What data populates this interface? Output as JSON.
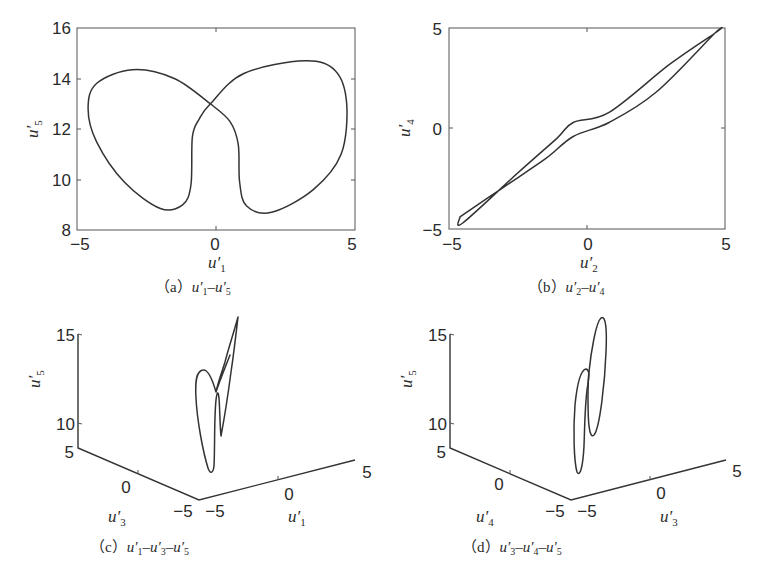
{
  "figure": {
    "panels": [
      {
        "id": "a",
        "caption_prefix": "（a）",
        "caption_vars": [
          {
            "base": "u",
            "sub": "1"
          },
          {
            "base": "u",
            "sub": "5"
          }
        ],
        "xlabel": {
          "base": "u",
          "sub": "1"
        },
        "ylabel": {
          "base": "u",
          "sub": "5"
        },
        "xticks": [
          "−5",
          "0",
          "5"
        ],
        "yticks": [
          "16",
          "14",
          "12",
          "10",
          "8"
        ]
      },
      {
        "id": "b",
        "caption_prefix": "（b）",
        "caption_vars": [
          {
            "base": "u",
            "sub": "2"
          },
          {
            "base": "u",
            "sub": "4"
          }
        ],
        "xlabel": {
          "base": "u",
          "sub": "2"
        },
        "ylabel": {
          "base": "u",
          "sub": "4"
        },
        "xticks": [
          "−5",
          "0",
          "5"
        ],
        "yticks": [
          "5",
          "0",
          "−5"
        ]
      },
      {
        "id": "c",
        "caption_prefix": "（c）",
        "caption_vars": [
          {
            "base": "u",
            "sub": "1"
          },
          {
            "base": "u",
            "sub": "3"
          },
          {
            "base": "u",
            "sub": "5"
          }
        ],
        "xlabel": {
          "base": "u",
          "sub": "1"
        },
        "ylabel": {
          "base": "u",
          "sub": "3"
        },
        "zlabel": {
          "base": "u",
          "sub": "5"
        },
        "xticks": [
          "−5",
          "0",
          "5"
        ],
        "yticks": [
          "5",
          "0",
          "−5"
        ],
        "zticks": [
          "15",
          "10",
          "5"
        ]
      },
      {
        "id": "d",
        "caption_prefix": "（d）",
        "caption_vars": [
          {
            "base": "u",
            "sub": "3"
          },
          {
            "base": "u",
            "sub": "4"
          },
          {
            "base": "u",
            "sub": "5"
          }
        ],
        "xlabel": {
          "base": "u",
          "sub": "3"
        },
        "ylabel": {
          "base": "u",
          "sub": "4"
        },
        "zlabel": {
          "base": "u",
          "sub": "5"
        },
        "xticks": [
          "−5",
          "0",
          "5"
        ],
        "yticks": [
          "5",
          "0",
          "−5"
        ],
        "zticks": [
          "15",
          "10",
          "5"
        ]
      }
    ]
  },
  "chart_data": [
    {
      "type": "line",
      "title": "(a) u1'-u5'",
      "xlabel": "u1'",
      "ylabel": "u5'",
      "xlim": [
        -5,
        5
      ],
      "ylim": [
        8,
        16
      ],
      "grid": false,
      "series": [
        {
          "name": "phase portrait u1'-u5' (figure-eight attractor)",
          "x": [
            -0.2,
            -1.5,
            -3.0,
            -4.3,
            -4.6,
            -4.3,
            -3.3,
            -2.0,
            -1.2,
            -0.9,
            -0.85,
            -0.6,
            -0.2,
            1.0,
            3.2,
            4.3,
            4.7,
            4.5,
            3.5,
            2.0,
            1.1,
            0.85,
            0.8,
            0.5,
            -0.2
          ],
          "y": [
            13.0,
            14.0,
            14.35,
            13.8,
            12.8,
            11.5,
            9.9,
            8.85,
            9.0,
            9.8,
            11.7,
            12.4,
            13.0,
            14.2,
            14.7,
            14.3,
            13.0,
            11.0,
            9.6,
            8.7,
            8.95,
            9.9,
            11.4,
            12.3,
            13.0
          ]
        }
      ]
    },
    {
      "type": "line",
      "title": "(b) u2'-u4'",
      "xlabel": "u2'",
      "ylabel": "u4'",
      "xlim": [
        -5,
        5
      ],
      "ylim": [
        -5,
        5
      ],
      "grid": false,
      "series": [
        {
          "name": "phase portrait u2'-u4' (narrow diagonal loop)",
          "x": [
            -4.6,
            -3.0,
            -1.5,
            -0.5,
            0.8,
            2.5,
            4.6,
            4.7,
            3.0,
            0.8,
            -0.5,
            -1.1,
            -2.5,
            -4.5,
            -4.6
          ],
          "y": [
            -4.4,
            -2.9,
            -1.5,
            -0.4,
            0.3,
            1.8,
            4.7,
            4.8,
            3.2,
            0.8,
            0.3,
            -0.5,
            -2.2,
            -4.7,
            -4.4
          ]
        }
      ]
    },
    {
      "type": "line",
      "title": "(c) u1'-u3'-u5'",
      "projection": "3d",
      "xlabel": "u1'",
      "ylabel": "u3'",
      "zlabel": "u5'",
      "xlim": [
        -5,
        5
      ],
      "ylim": [
        -5,
        5
      ],
      "zlim": [
        5,
        15
      ],
      "note": "3D trajectory: tall folded loop with a narrow V-shaped lobe, rising to z ≈ 16"
    },
    {
      "type": "line",
      "title": "(d) u3'-u4'-u5'",
      "projection": "3d",
      "xlabel": "u3'",
      "ylabel": "u4'",
      "zlabel": "u5'",
      "xlim": [
        -5,
        5
      ],
      "ylim": [
        -5,
        5
      ],
      "zlim": [
        5,
        15
      ],
      "note": "3D trajectory: two interlinked elongated ellipse-like loops, upper loop reaching z ≈ 16"
    }
  ]
}
